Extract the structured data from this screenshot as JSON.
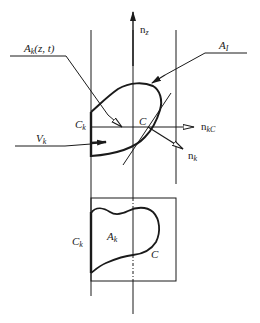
{
  "colors": {
    "ink": "#1a1a1a",
    "background": "#ffffff"
  },
  "diagram": {
    "labels": {
      "n_z": {
        "base": "n",
        "sub": "z"
      },
      "A_k_zt": {
        "base": "A",
        "sub": "k",
        "suffix": "(z, t)"
      },
      "A_I": {
        "base": "A",
        "sub": "I"
      },
      "C_k_upper": {
        "base": "C",
        "sub": "k"
      },
      "C_upper": "C",
      "n_kC": {
        "base": "n",
        "sub": "kC"
      },
      "V_k": {
        "base": "V",
        "sub": "k"
      },
      "n_k": {
        "base": "n",
        "sub": "k"
      },
      "C_k_lower": {
        "base": "C",
        "sub": "k"
      },
      "A_k_lower": {
        "base": "A",
        "sub": "k"
      },
      "C_lower": "C"
    },
    "upper_view": {
      "description": "Side view of control volume slice with interface area and normals",
      "vectors": [
        "n_z",
        "n_kC",
        "n_k",
        "V_k"
      ]
    },
    "lower_view": {
      "description": "Cross-section of phase area A_k bounded by contour C and wall C_k"
    }
  }
}
